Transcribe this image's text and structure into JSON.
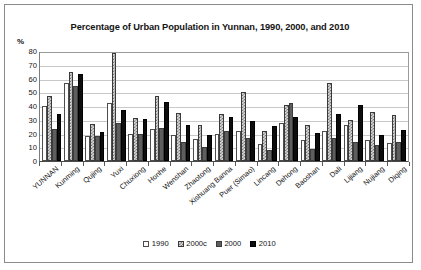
{
  "chart_data": {
    "type": "bar",
    "title": "Percentage of Urban Population in Yunnan, 1990, 2000, and 2010",
    "xlabel": "",
    "ylabel": "%",
    "ylim": [
      0,
      80
    ],
    "yticks": [
      0,
      10,
      20,
      30,
      40,
      50,
      60,
      70,
      80
    ],
    "grid": true,
    "legend_position": "bottom",
    "categories": [
      "YUNNAN",
      "Kunming",
      "Qujing",
      "Yuxi",
      "Chuxiong",
      "Honhe",
      "Wenshan",
      "Zhaotong",
      "Xishuang Banna",
      "Puer (Simao)",
      "Lincang",
      "Dehong",
      "Baoshan",
      "Dali",
      "Lijiang",
      "Nujiang",
      "Diqing"
    ],
    "series": [
      {
        "name": "1990",
        "values": [
          40.3,
          56.5,
          18.5,
          42.5,
          20.0,
          23.5,
          19.0,
          16.0,
          19.5,
          22.0,
          12.5,
          27.5,
          15.5,
          21.5,
          26.5,
          15.5,
          13.0
        ]
      },
      {
        "name": "2000c",
        "values": [
          47.3,
          65.0,
          27.0,
          78.5,
          31.5,
          47.0,
          35.0,
          26.5,
          34.5,
          50.0,
          21.5,
          41.0,
          26.5,
          57.0,
          30.0,
          36.0,
          33.5
        ]
      },
      {
        "name": "2000",
        "values": [
          23.0,
          54.5,
          18.5,
          27.5,
          19.5,
          24.0,
          14.0,
          10.5,
          21.5,
          16.5,
          8.0,
          42.0,
          8.5,
          17.0,
          13.5,
          12.0,
          13.5
        ]
      },
      {
        "name": "2010",
        "values": [
          34.5,
          63.5,
          21.0,
          37.0,
          30.5,
          43.0,
          26.5,
          19.0,
          32.0,
          29.0,
          25.5,
          32.0,
          20.5,
          34.0,
          41.0,
          19.0,
          22.5
        ]
      }
    ]
  },
  "legend": {
    "items": [
      {
        "label": "1990",
        "swatch": "white-open-square"
      },
      {
        "label": "2000c",
        "swatch": "checkered-square"
      },
      {
        "label": "2000",
        "swatch": "dark-gray-square"
      },
      {
        "label": "2010",
        "swatch": "black-square"
      }
    ]
  }
}
